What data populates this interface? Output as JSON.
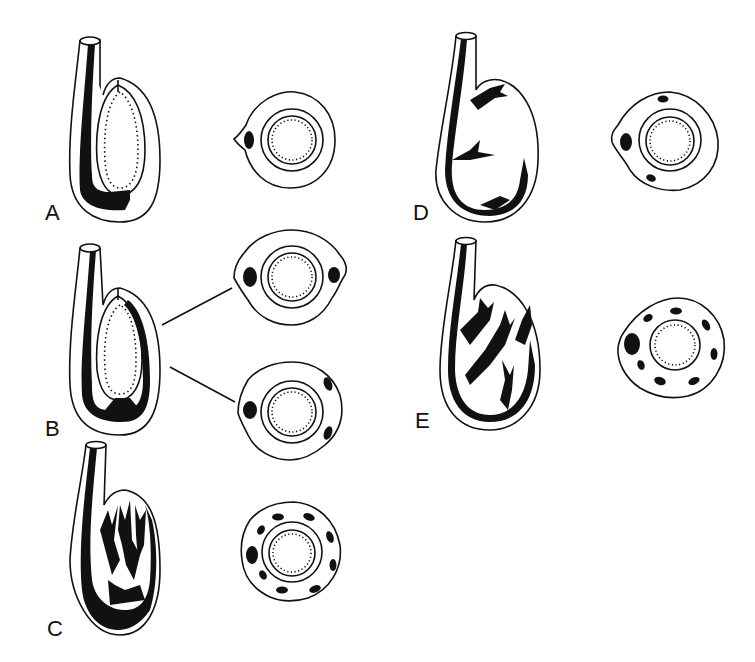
{
  "figure": {
    "panels": [
      {
        "id": "A",
        "label": "A",
        "sections": 1,
        "bundles": [
          1
        ]
      },
      {
        "id": "B",
        "label": "B",
        "sections": 2,
        "bundles": [
          2,
          3
        ]
      },
      {
        "id": "C",
        "label": "C",
        "sections": 1,
        "bundles": [
          10
        ]
      },
      {
        "id": "D",
        "label": "D",
        "sections": 1,
        "bundles": [
          3
        ]
      },
      {
        "id": "E",
        "label": "E",
        "sections": 1,
        "bundles": [
          9
        ]
      }
    ],
    "colors": {
      "ink": "#111111",
      "paper": "#ffffff"
    }
  }
}
